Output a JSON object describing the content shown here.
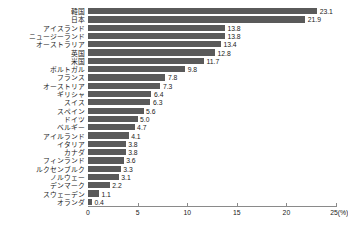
{
  "chart_data": {
    "type": "bar",
    "orientation": "horizontal",
    "title": "",
    "xlabel": "",
    "ylabel": "",
    "xlim": [
      0,
      25
    ],
    "grid": false,
    "legend": false,
    "unit_suffix": "(%)",
    "categories": [
      "韓国",
      "日本",
      "アイスランド",
      "ニュージーランド",
      "オーストラリア",
      "英国",
      "米国",
      "ポルトガル",
      "フランス",
      "オーストリア",
      "ギリシャ",
      "スイス",
      "スペイン",
      "ドイツ",
      "ベルギー",
      "アイルランド",
      "イタリア",
      "カナダ",
      "フィンランド",
      "ルクセンブルク",
      "ノルウェー",
      "デンマーク",
      "スウェーデン",
      "オランダ"
    ],
    "values": [
      23.1,
      21.9,
      13.8,
      13.8,
      13.4,
      12.8,
      11.7,
      9.8,
      7.8,
      7.3,
      6.4,
      6.3,
      5.6,
      5.0,
      4.7,
      4.1,
      3.8,
      3.8,
      3.6,
      3.3,
      3.1,
      2.2,
      1.1,
      0.4
    ],
    "value_labels": [
      "23.1",
      "21.9",
      "13.8",
      "13.8",
      "13.4",
      "12.8",
      "11.7",
      "9.8",
      "7.8",
      "7.3",
      "6.4",
      "6.3",
      "5.6",
      "5.0",
      "4.7",
      "4.1",
      "3.8",
      "3.8",
      "3.6",
      "3.3",
      "3.1",
      "2.2",
      "1.1",
      "0.4"
    ],
    "xticks": [
      0,
      5,
      10,
      15,
      20,
      25
    ],
    "xtick_labels": [
      "0",
      "5",
      "10",
      "15",
      "20",
      "25(%)"
    ],
    "bar_color": "#5a5a5a",
    "axis_color": "#8a8a8a",
    "text_color": "#1a1a1a"
  }
}
